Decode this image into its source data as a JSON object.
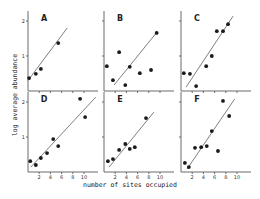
{
  "chart_data": {
    "type": "scatter",
    "title": "",
    "xlabel": "number of sites occupied",
    "ylabel": "log average abundance",
    "xlim": [
      0,
      12
    ],
    "ylim": [
      0,
      2.3
    ],
    "x_ticks": [
      2,
      4,
      6,
      8,
      10
    ],
    "x_tick_labels": [
      "2",
      "4",
      "6",
      "8",
      "10"
    ],
    "y_ticks": [
      1,
      2
    ],
    "y_tick_labels": [
      "1",
      "2"
    ],
    "grid": false,
    "legend": "none",
    "panels": [
      {
        "label": "A",
        "points": [
          [
            0.2,
            0.37
          ],
          [
            1.4,
            0.49
          ],
          [
            2.3,
            0.63
          ],
          [
            5.4,
            1.37
          ]
        ],
        "fit_line": [
          [
            0.0,
            0.3
          ],
          [
            7.0,
            1.8
          ]
        ]
      },
      {
        "label": "B",
        "points": [
          [
            0.5,
            0.71
          ],
          [
            1.6,
            0.31
          ],
          [
            2.7,
            1.11
          ],
          [
            3.8,
            0.17
          ],
          [
            4.6,
            0.69
          ],
          [
            6.4,
            0.51
          ],
          [
            8.4,
            0.6
          ],
          [
            9.4,
            1.66
          ]
        ],
        "fit_line": [
          [
            1.8,
            0.17
          ],
          [
            9.5,
            1.69
          ]
        ]
      },
      {
        "label": "C",
        "points": [
          [
            0.5,
            0.51
          ],
          [
            1.6,
            0.49
          ],
          [
            2.7,
            0.14
          ],
          [
            4.5,
            0.71
          ],
          [
            5.5,
            1.0
          ],
          [
            6.4,
            1.71
          ],
          [
            7.5,
            1.71
          ],
          [
            8.4,
            1.91
          ]
        ],
        "fit_line": [
          [
            0.9,
            0.11
          ],
          [
            9.3,
            2.14
          ]
        ]
      },
      {
        "label": "D",
        "points": [
          [
            0.4,
            0.31
          ],
          [
            1.4,
            0.2
          ],
          [
            2.3,
            0.4
          ],
          [
            3.4,
            0.54
          ],
          [
            4.5,
            0.94
          ],
          [
            5.4,
            0.74
          ],
          [
            9.3,
            2.09
          ],
          [
            10.2,
            1.57
          ]
        ],
        "fit_line": [
          [
            0.5,
            0.14
          ],
          [
            12.1,
            2.14
          ]
        ]
      },
      {
        "label": "E",
        "points": [
          [
            0.7,
            0.31
          ],
          [
            1.6,
            0.37
          ],
          [
            2.7,
            0.63
          ],
          [
            3.8,
            0.8
          ],
          [
            4.6,
            0.66
          ],
          [
            5.5,
            0.71
          ],
          [
            7.5,
            1.54
          ]
        ],
        "fit_line": [
          [
            0.9,
            0.14
          ],
          [
            8.9,
            1.71
          ]
        ]
      },
      {
        "label": "F",
        "points": [
          [
            0.7,
            0.26
          ],
          [
            1.4,
            0.14
          ],
          [
            2.5,
            0.69
          ],
          [
            3.6,
            0.71
          ],
          [
            4.6,
            0.74
          ],
          [
            5.5,
            1.17
          ],
          [
            6.6,
            0.6
          ],
          [
            7.5,
            2.03
          ],
          [
            8.6,
            1.6
          ]
        ],
        "fit_line": [
          [
            1.1,
            0.09
          ],
          [
            9.6,
            2.09
          ]
        ]
      }
    ]
  }
}
